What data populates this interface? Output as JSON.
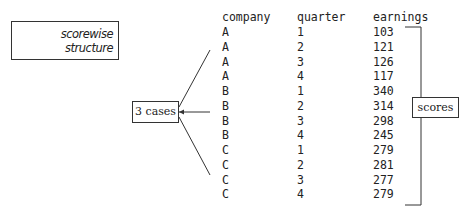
{
  "title_box": {
    "lines": [
      "scorewise",
      "structure"
    ]
  },
  "cases_label": "3 cases",
  "scores_label": "scores",
  "table": {
    "headers": [
      "company",
      "quarter",
      "earnings"
    ],
    "rows": [
      [
        "A",
        "1",
        "103"
      ],
      [
        "A",
        "2",
        "121"
      ],
      [
        "A",
        "3",
        "126"
      ],
      [
        "A",
        "4",
        "117"
      ],
      [
        "B",
        "1",
        "340"
      ],
      [
        "B",
        "2",
        "314"
      ],
      [
        "B",
        "3",
        "298"
      ],
      [
        "B",
        "4",
        "245"
      ],
      [
        "C",
        "1",
        "279"
      ],
      [
        "C",
        "2",
        "281"
      ],
      [
        "C",
        "3",
        "277"
      ],
      [
        "C",
        "4",
        "279"
      ]
    ]
  }
}
